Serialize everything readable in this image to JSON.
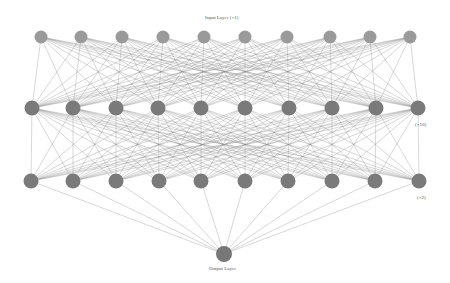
{
  "diagram": {
    "type": "neural-network",
    "labels": {
      "input": "Input Layer (×1)",
      "hidden1": "(×10)",
      "hidden2": "(×2)",
      "output": "Output Layer"
    },
    "colors": {
      "background": "#ffffff",
      "edge": "#8a8a8a",
      "input_node": "#9a9a9a",
      "hidden_node": "#7a7a7a",
      "output_node": "#777777"
    },
    "layers": [
      {
        "name": "input",
        "y": 37,
        "r": 6.5,
        "x": [
          41,
          81,
          122,
          163,
          204,
          245,
          287,
          330,
          370,
          410
        ]
      },
      {
        "name": "hidden1",
        "y": 108,
        "r": 7.5,
        "x": [
          32,
          73,
          116,
          158,
          201,
          245,
          289,
          332,
          376,
          418
        ]
      },
      {
        "name": "hidden2",
        "y": 181,
        "r": 7.5,
        "x": [
          31,
          73,
          116,
          159,
          201,
          245,
          288,
          332,
          375,
          419
        ]
      },
      {
        "name": "output",
        "y": 254,
        "r": 8,
        "x": [
          224
        ]
      }
    ]
  }
}
